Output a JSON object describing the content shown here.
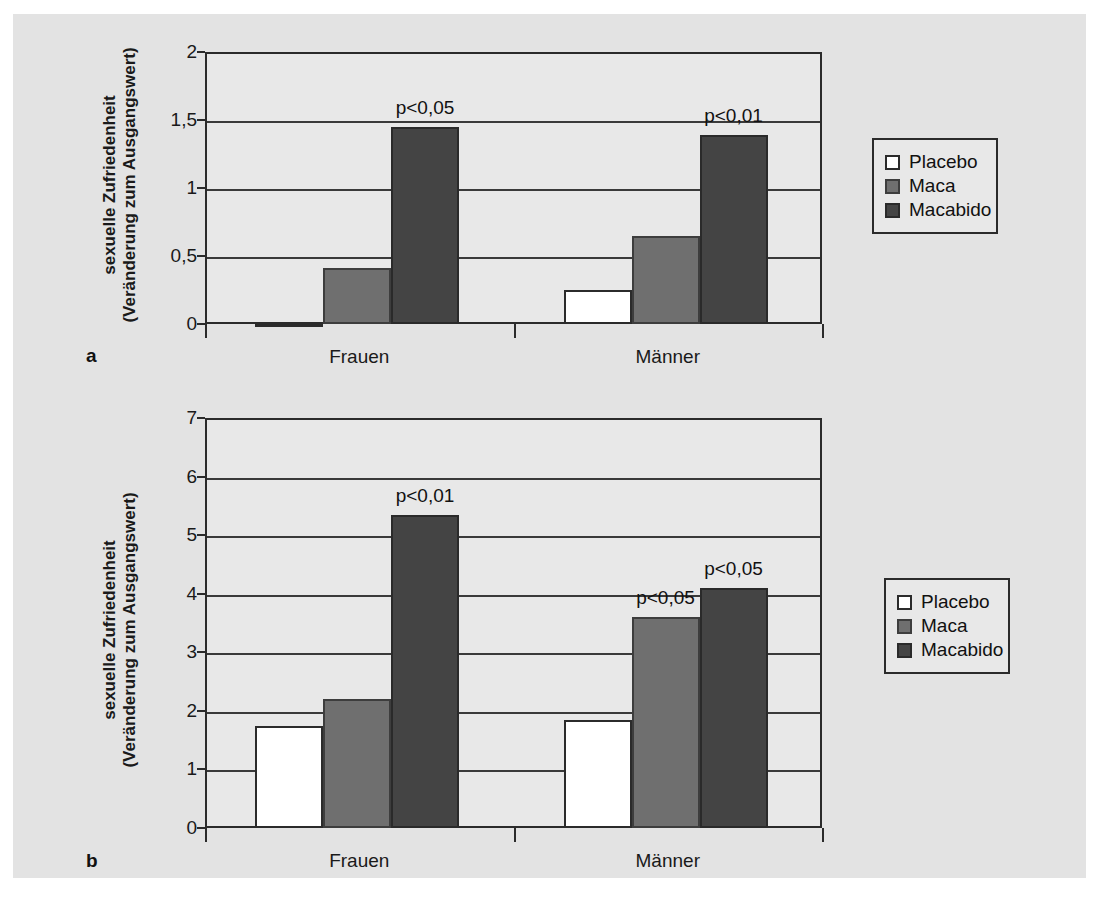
{
  "figure": {
    "background_color": "#e3e3e3",
    "panels": [
      {
        "letter": "a",
        "axis_title_line1": "sexuelle Zufriedenheit",
        "axis_title_line2": "(Veränderung zum Ausgangswert)"
      },
      {
        "letter": "b",
        "axis_title_line1": "sexuelle Zufriedenheit",
        "axis_title_line2": "(Veränderung zum Ausgangswert)"
      }
    ]
  },
  "legend": {
    "items": [
      {
        "label": "Placebo",
        "color": "#ffffff"
      },
      {
        "label": "Maca",
        "color": "#6f6f6f"
      },
      {
        "label": "Macabido",
        "color": "#444444"
      }
    ]
  },
  "chart_data": [
    {
      "type": "bar",
      "panel": "a",
      "title": "",
      "xlabel": "",
      "ylabel": "sexuelle Zufriedenheit (Veränderung zum Ausgangswert)",
      "categories": [
        "Frauen",
        "Männer"
      ],
      "ylim": [
        0,
        2
      ],
      "yticks": [
        0,
        0.5,
        1,
        1.5,
        2
      ],
      "ytick_labels": [
        "0",
        "0,5",
        "1",
        "1,5",
        "2"
      ],
      "grid": true,
      "legend_position": "right",
      "series": [
        {
          "name": "Placebo",
          "values": [
            0.01,
            0.25
          ]
        },
        {
          "name": "Maca",
          "values": [
            0.41,
            0.65
          ]
        },
        {
          "name": "Macabido",
          "values": [
            1.45,
            1.39
          ]
        }
      ],
      "annotations": [
        {
          "text": "p<0,05",
          "category": "Frauen",
          "series": "Macabido"
        },
        {
          "text": "p<0,01",
          "category": "Männer",
          "series": "Macabido"
        }
      ]
    },
    {
      "type": "bar",
      "panel": "b",
      "title": "",
      "xlabel": "",
      "ylabel": "sexuelle Zufriedenheit (Veränderung zum Ausgangswert)",
      "categories": [
        "Frauen",
        "Männer"
      ],
      "ylim": [
        0,
        7
      ],
      "yticks": [
        0,
        1,
        2,
        3,
        4,
        5,
        6,
        7
      ],
      "ytick_labels": [
        "0",
        "1",
        "2",
        "3",
        "4",
        "5",
        "6",
        "7"
      ],
      "grid": true,
      "legend_position": "right",
      "series": [
        {
          "name": "Placebo",
          "values": [
            1.75,
            1.85
          ]
        },
        {
          "name": "Maca",
          "values": [
            2.2,
            3.6
          ]
        },
        {
          "name": "Macabido",
          "values": [
            5.35,
            4.1
          ]
        }
      ],
      "annotations": [
        {
          "text": "p<0,01",
          "category": "Frauen",
          "series": "Macabido"
        },
        {
          "text": "p<0,05",
          "category": "Männer",
          "series": "Maca"
        },
        {
          "text": "p<0,05",
          "category": "Männer",
          "series": "Macabido"
        }
      ]
    }
  ]
}
